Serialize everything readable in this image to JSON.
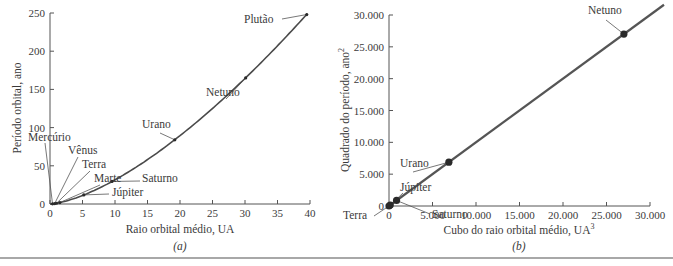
{
  "chart_data": [
    {
      "id": "a",
      "type": "line",
      "panel_label": "(a)",
      "title": "",
      "xlabel": "Raio orbital médio, UA",
      "ylabel": "Período orbital, ano",
      "xlim": [
        0,
        40
      ],
      "ylim": [
        0,
        250
      ],
      "xticks": [
        0,
        5,
        10,
        15,
        20,
        25,
        30,
        35,
        40
      ],
      "yticks": [
        0,
        50,
        100,
        150,
        200,
        250
      ],
      "xtick_labels": [
        "0",
        "5",
        "10",
        "15",
        "20",
        "25",
        "30",
        "35",
        "40"
      ],
      "ytick_labels": [
        "0",
        "50",
        "100",
        "150",
        "200",
        "250"
      ],
      "grid": false,
      "legend": null,
      "line_color": "#4a4a4a",
      "series": [
        {
          "name": "Planetas",
          "points": [
            {
              "label": "Mercúrio",
              "x": 0.39,
              "y": 0.24
            },
            {
              "label": "Vênus",
              "x": 0.72,
              "y": 0.62
            },
            {
              "label": "Terra",
              "x": 1.0,
              "y": 1.0
            },
            {
              "label": "Marte",
              "x": 1.52,
              "y": 1.88
            },
            {
              "label": "Júpiter",
              "x": 5.2,
              "y": 11.9
            },
            {
              "label": "Saturno",
              "x": 9.54,
              "y": 29.5
            },
            {
              "label": "Urano",
              "x": 19.2,
              "y": 84
            },
            {
              "label": "Netuno",
              "x": 30.1,
              "y": 165
            },
            {
              "label": "Plutão",
              "x": 39.5,
              "y": 248
            }
          ]
        }
      ]
    },
    {
      "id": "b",
      "type": "line",
      "panel_label": "(b)",
      "title": "",
      "xlabel": "Cubo do raio orbital médio, UA",
      "xlabel_superscript": "3",
      "ylabel": "Quadrado do período, ano",
      "ylabel_superscript": "2",
      "xlim": [
        0,
        30000
      ],
      "ylim": [
        0,
        30000
      ],
      "xticks": [
        0,
        5000,
        10000,
        15000,
        20000,
        25000,
        30000
      ],
      "yticks": [
        0,
        5000,
        10000,
        15000,
        20000,
        25000,
        30000
      ],
      "xtick_labels": [
        "0",
        "5.000",
        "10.000",
        "15.000",
        "20.000",
        "25.000",
        "30.000"
      ],
      "ytick_labels": [
        "0",
        "5.000",
        "10.000",
        "15.000",
        "20.000",
        "25.000",
        "30.000"
      ],
      "grid": false,
      "legend": null,
      "line_color": "#555555",
      "series": [
        {
          "name": "Planetas",
          "points": [
            {
              "label": "Terra",
              "x": 1,
              "y": 1
            },
            {
              "label": "Júpiter",
              "x": 141,
              "y": 141
            },
            {
              "label": "Saturno",
              "x": 868,
              "y": 868
            },
            {
              "label": "Urano",
              "x": 6880,
              "y": 6880
            },
            {
              "label": "Netuno",
              "x": 27000,
              "y": 27000
            }
          ]
        }
      ]
    }
  ]
}
